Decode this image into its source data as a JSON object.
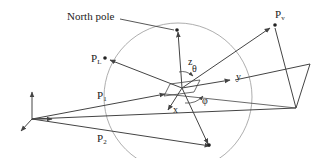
{
  "labels": {
    "north_pole": "North pole",
    "pl": "P",
    "pl_sub": "L",
    "pv": "P",
    "pv_sub": "v",
    "p1": "P",
    "p1_sub": "1",
    "p2": "P",
    "p2_sub": "2",
    "z": "z",
    "theta": "θ",
    "y": "y",
    "x": "x",
    "phi": "φ"
  },
  "colors": {
    "line": "#444444",
    "circle": "#999999",
    "text": "#222222"
  }
}
